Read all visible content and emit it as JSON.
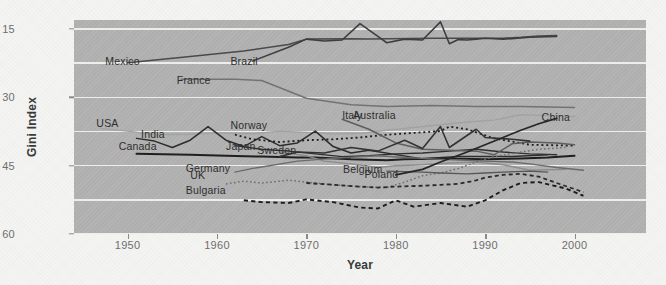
{
  "chart_data": {
    "type": "line",
    "title": "",
    "subtitle": "",
    "xlabel": "Year",
    "ylabel": "Gini Index",
    "xlim": [
      1944,
      2008
    ],
    "ylim": [
      15,
      62
    ],
    "xticks": [
      1950,
      1960,
      1970,
      1980,
      1990,
      2000
    ],
    "yticks": [
      15,
      30,
      45,
      60
    ],
    "gridlines_y": [
      15.0,
      22.5,
      30.0,
      37.5,
      45.0,
      52.5,
      60.0
    ],
    "grid": "horizontal-only",
    "legend": "inline-labels",
    "plot_background": "#b1b1b1",
    "gridline_color": "#f0f0ee",
    "series": [
      {
        "name": "Mexico",
        "style": "solid",
        "color": "#4a4a4a",
        "width": 1.5,
        "label_x": 1947.5,
        "label_y": 52.8,
        "x": [
          1950,
          1957,
          1963,
          1968,
          1970,
          1975,
          1977,
          1984,
          1989,
          1992,
          1994,
          1996,
          1998
        ],
        "y": [
          52.6,
          54.0,
          55.2,
          56.6,
          57.8,
          57.9,
          57.8,
          58.0,
          58.0,
          58.0,
          58.2,
          58.5,
          58.6
        ]
      },
      {
        "name": "Brazil",
        "style": "solid",
        "color": "#3e3e3e",
        "width": 1.6,
        "label_x": 1961.5,
        "label_y": 52.9,
        "x": [
          1964,
          1968,
          1970,
          1972,
          1974,
          1976,
          1978,
          1979,
          1981,
          1983,
          1985,
          1986,
          1987,
          1988,
          1989,
          1990,
          1992,
          1993,
          1995,
          1998
        ],
        "y": [
          53.0,
          56.0,
          57.8,
          57.4,
          57.6,
          61.2,
          58.4,
          57.0,
          57.8,
          57.6,
          61.6,
          56.8,
          57.7,
          57.6,
          57.8,
          58.0,
          57.8,
          57.9,
          58.2,
          58.4
        ]
      },
      {
        "name": "France",
        "style": "solid",
        "color": "#737373",
        "width": 1.5,
        "label_x": 1955.5,
        "label_y": 48.8,
        "x": [
          1956,
          1962,
          1965,
          1970,
          1975,
          1979,
          1984,
          1989,
          1994,
          2000
        ],
        "y": [
          49.0,
          49.0,
          48.7,
          44.8,
          43.4,
          43.0,
          43.2,
          43.0,
          43.0,
          42.8
        ]
      },
      {
        "name": "USA",
        "style": "solid",
        "color": "#a2a2a2",
        "width": 1.4,
        "label_x": 1946.5,
        "label_y": 39.3,
        "x": [
          1947,
          1950,
          1953,
          1957,
          1960,
          1964,
          1967,
          1970,
          1973,
          1976,
          1979,
          1982,
          1985,
          1988,
          1991,
          1994,
          1997,
          2000
        ],
        "y": [
          38.2,
          37.6,
          36.8,
          36.9,
          37.2,
          37.0,
          37.6,
          37.3,
          37.0,
          37.1,
          37.8,
          38.4,
          39.0,
          39.6,
          40.0,
          41.2,
          41.0,
          40.8
        ]
      },
      {
        "name": "India",
        "style": "solid",
        "color": "#2d2d2d",
        "width": 1.5,
        "label_x": 1951.5,
        "label_y": 36.8,
        "x": [
          1951,
          1953,
          1955,
          1957,
          1959,
          1961,
          1963,
          1965,
          1967,
          1969,
          1971,
          1973,
          1975,
          1977,
          1983,
          1987,
          1993,
          1997
        ],
        "y": [
          36.0,
          35.4,
          34.0,
          35.6,
          38.6,
          35.6,
          34.2,
          36.4,
          34.4,
          35.0,
          37.6,
          34.2,
          32.8,
          33.4,
          31.5,
          32.0,
          32.0,
          32.4
        ]
      },
      {
        "name": "Canada",
        "style": "solid",
        "color": "#1f1f1f",
        "width": 2.0,
        "label_x": 1949.0,
        "label_y": 34.2,
        "x": [
          1951,
          1957,
          1961,
          1965,
          1969,
          1971,
          1975,
          1979,
          1981,
          1985,
          1987,
          1990,
          1994,
          1997,
          2000
        ],
        "y": [
          32.6,
          32.4,
          32.2,
          32.0,
          31.8,
          31.8,
          31.4,
          31.2,
          31.4,
          31.6,
          31.5,
          31.4,
          31.6,
          31.8,
          32.2
        ]
      },
      {
        "name": "Norway",
        "style": "dotted",
        "color": "#1e1e1e",
        "width": 1.8,
        "label_x": 1961.5,
        "label_y": 38.8,
        "x": [
          1962,
          1964,
          1967,
          1970,
          1973,
          1976,
          1979,
          1982,
          1985,
          1986,
          1988,
          1991,
          1995,
          2000
        ],
        "y": [
          36.8,
          35.8,
          35.2,
          35.6,
          35.8,
          36.2,
          36.8,
          37.2,
          37.6,
          38.6,
          38.0,
          36.0,
          34.6,
          34.4
        ]
      },
      {
        "name": "Japan",
        "style": "solid",
        "color": "#303030",
        "width": 1.4,
        "label_x": 1961.0,
        "label_y": 34.2,
        "x": [
          1962,
          1965,
          1968,
          1971,
          1974,
          1977,
          1980,
          1983,
          1986,
          1989,
          1992,
          1995,
          1998
        ],
        "y": [
          34.4,
          33.6,
          33.2,
          32.6,
          32.0,
          32.2,
          32.6,
          32.8,
          33.2,
          33.6,
          33.0,
          32.6,
          32.4
        ]
      },
      {
        "name": "Sweden",
        "style": "solid",
        "color": "#8c8c8c",
        "width": 1.4,
        "label_x": 1964.5,
        "label_y": 33.3,
        "x": [
          1967,
          1970,
          1972,
          1975,
          1978,
          1980,
          1983,
          1986,
          1989,
          1992,
          1995,
          1999
        ],
        "y": [
          33.0,
          32.2,
          31.0,
          30.4,
          29.6,
          30.0,
          30.2,
          30.6,
          30.8,
          30.2,
          29.0,
          29.2
        ]
      },
      {
        "name": "Italy",
        "style": "solid",
        "color": "#5e5e5e",
        "width": 1.5,
        "label_x": 1974.0,
        "label_y": 41.0,
        "x": [
          1974,
          1977,
          1980,
          1983,
          1986,
          1989,
          1991,
          1993,
          1995,
          1998,
          2000
        ],
        "y": [
          40.2,
          38.0,
          35.0,
          33.6,
          33.4,
          33.2,
          32.4,
          34.8,
          35.2,
          35.0,
          34.6
        ]
      },
      {
        "name": "Germany",
        "style": "solid",
        "color": "#6b6b6b",
        "width": 1.4,
        "label_x": 1956.5,
        "label_y": 29.4,
        "x": [
          1962,
          1964,
          1969,
          1973,
          1978,
          1981,
          1983,
          1985,
          1988,
          1990,
          1993,
          1995,
          1998,
          2001
        ],
        "y": [
          28.6,
          29.4,
          31.0,
          31.6,
          32.2,
          31.8,
          31.6,
          31.4,
          31.2,
          31.0,
          30.8,
          30.4,
          29.6,
          29.0
        ]
      },
      {
        "name": "UK",
        "style": "dotted",
        "color": "#707070",
        "width": 1.5,
        "label_x": 1957.0,
        "label_y": 27.8,
        "x": [
          1961,
          1963,
          1965,
          1968,
          1970,
          1973,
          1976,
          1979,
          1981,
          1983,
          1985,
          1987,
          1989,
          1991,
          1994,
          1996,
          1999
        ],
        "y": [
          26.0,
          26.6,
          26.2,
          26.8,
          26.4,
          25.8,
          25.4,
          25.2,
          26.4,
          27.8,
          28.4,
          29.4,
          30.8,
          32.0,
          33.0,
          33.6,
          34.0
        ]
      },
      {
        "name": "Bulgaria",
        "style": "dashed",
        "color": "#1c1c1c",
        "width": 1.9,
        "label_x": 1956.5,
        "label_y": 24.6,
        "x": [
          1963,
          1965,
          1968,
          1970,
          1973,
          1976,
          1978,
          1980,
          1982,
          1985,
          1988,
          1990,
          1992,
          1994,
          1996,
          1999,
          2001
        ],
        "y": [
          22.4,
          22.0,
          21.8,
          22.6,
          22.0,
          20.8,
          20.6,
          22.4,
          21.0,
          21.8,
          21.0,
          22.4,
          24.6,
          26.2,
          26.4,
          25.0,
          23.4
        ]
      },
      {
        "name": "Poland",
        "style": "dashed",
        "color": "#2a2a2a",
        "width": 1.8,
        "label_x": 1976.5,
        "label_y": 28.0,
        "x": [
          1970,
          1973,
          1976,
          1978,
          1980,
          1983,
          1985,
          1987,
          1989,
          1990,
          1992,
          1994,
          1996,
          1998,
          2001
        ],
        "y": [
          26.2,
          25.8,
          25.4,
          25.2,
          25.4,
          25.6,
          25.8,
          26.0,
          26.8,
          27.4,
          28.0,
          28.2,
          27.6,
          26.2,
          24.2
        ]
      },
      {
        "name": "Belgium",
        "style": "solid",
        "color": "#585858",
        "width": 1.4,
        "label_x": 1978.5,
        "label_y": 29.2,
        "x": [
          1979,
          1983,
          1985,
          1988,
          1990,
          1992,
          1995,
          1997
        ],
        "y": [
          28.8,
          28.6,
          28.4,
          28.2,
          28.4,
          28.6,
          28.8,
          28.6
        ]
      },
      {
        "name": "Australia",
        "style": "solid",
        "color": "#333333",
        "width": 1.6,
        "label_x": 1980.0,
        "label_y": 41.0,
        "x": [
          1967,
          1969,
          1972,
          1975,
          1978,
          1981,
          1983,
          1985,
          1986,
          1989,
          1990,
          1993,
          1995
        ],
        "y": [
          32.0,
          33.0,
          32.8,
          34.0,
          33.2,
          35.6,
          33.8,
          38.6,
          34.0,
          38.0,
          36.2,
          35.8,
          35.4
        ]
      },
      {
        "name": "China",
        "style": "solid",
        "color": "#262626",
        "width": 1.7,
        "label_x": 1999.5,
        "label_y": 40.6,
        "x": [
          1980,
          1983,
          1985,
          1988,
          1990,
          1992,
          1994,
          1996,
          1998
        ],
        "y": [
          28.0,
          29.2,
          30.8,
          33.0,
          34.6,
          36.2,
          37.8,
          39.2,
          40.4
        ]
      }
    ]
  },
  "axes": {
    "ylabel": "Gini Index",
    "xlabel": "Year",
    "yticks": [
      "60",
      "45",
      "30",
      "15"
    ],
    "xticks": [
      "1950",
      "1960",
      "1970",
      "1980",
      "1990",
      "2000"
    ]
  }
}
